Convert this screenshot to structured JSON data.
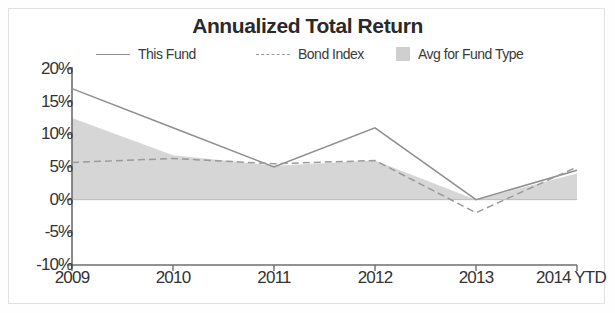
{
  "chart_data": {
    "type": "line",
    "title": "Annualized Total Return",
    "xlabel": "",
    "ylabel": "",
    "categories": [
      "2009",
      "2010",
      "2011",
      "2012",
      "2013",
      "2014 YTD"
    ],
    "ytick_labels": [
      "20%",
      "15%",
      "10%",
      "5%",
      "0%",
      "-5%",
      "-10%"
    ],
    "ytick_values": [
      20,
      15,
      10,
      5,
      0,
      -5,
      -10
    ],
    "ylim": [
      -10,
      20
    ],
    "grid": false,
    "legend_position": "top",
    "series": [
      {
        "name": "This Fund",
        "style": "solid-line",
        "color": "#8e8e8e",
        "values": [
          17.0,
          11.0,
          5.0,
          11.0,
          0.0,
          4.5
        ]
      },
      {
        "name": "Bond Index",
        "style": "dashed-line",
        "color": "#9a9a9a",
        "values": [
          5.7,
          6.3,
          5.5,
          6.0,
          -2.0,
          5.0
        ]
      },
      {
        "name": "Avg for Fund Type",
        "style": "filled-area",
        "color": "#cfcfcf",
        "values": [
          12.5,
          6.8,
          5.2,
          6.0,
          0.0,
          4.0
        ]
      }
    ]
  },
  "legend": {
    "items": [
      {
        "label": "This Fund",
        "marker": "solid-line-swatch"
      },
      {
        "label": "Bond Index",
        "marker": "dashed-line-swatch"
      },
      {
        "label": "Avg for Fund Type",
        "marker": "area-swatch"
      }
    ]
  },
  "colors": {
    "axis": "#6e6e6e",
    "text": "#333333",
    "area_fill": "#cfcfcf",
    "this_fund_line": "#8e8e8e",
    "bond_index_line": "#9a9a9a",
    "frame_border": "#e2e2e2"
  }
}
